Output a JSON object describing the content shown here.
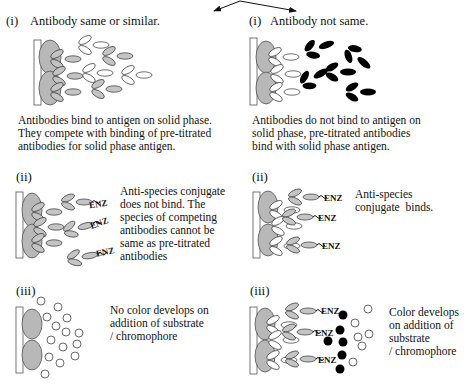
{
  "diagram": {
    "left": {
      "panel_i": {
        "label": "(i)",
        "title": "Antibody same or similar.",
        "caption": [
          "Antibodies bind to antigen on solid phase.",
          "They compete with binding of pre-titrated",
          "antibodies for solid phase antigen."
        ]
      },
      "panel_ii": {
        "label": "(ii)",
        "enz_labels": [
          "ENZ",
          "ENZ",
          "ENZ"
        ],
        "caption": [
          "Anti-species conjugate",
          "does not bind. The",
          "species of competing",
          "antibodies cannot be",
          "same as pre-titrated",
          "antibodies"
        ]
      },
      "panel_iii": {
        "label": "(iii)",
        "caption": [
          "No color develops on",
          "addition of substrate",
          "/ chromophore"
        ]
      }
    },
    "right": {
      "panel_i": {
        "label": "(i)",
        "title": "Antibody not same.",
        "caption": [
          "Antibodies do not bind to antigen on",
          "solid phase, pre-titrated antibodies",
          "bind with solid phase antigen."
        ]
      },
      "panel_ii": {
        "label": "(ii)",
        "enz_labels": [
          "ENZ",
          "ENZ",
          "ENZ"
        ],
        "caption": [
          "Anti-species",
          "conjugate  binds."
        ]
      },
      "panel_iii": {
        "label": "(iii)",
        "enz_labels": [
          "ENZ",
          "ENZ",
          "ENZ"
        ],
        "caption": [
          "Color develops",
          "on addition of",
          "substrate",
          "/ chromophore"
        ]
      }
    },
    "colors": {
      "antigen_fill": "#b8b8b8",
      "competing_antibody_fill": "#c4c4c4",
      "non_competing_antibody_fill": "#000000",
      "pretitrated_antibody_fill": "#ffffff",
      "colored_product": "#000000",
      "substrate": "#ffffff"
    }
  }
}
